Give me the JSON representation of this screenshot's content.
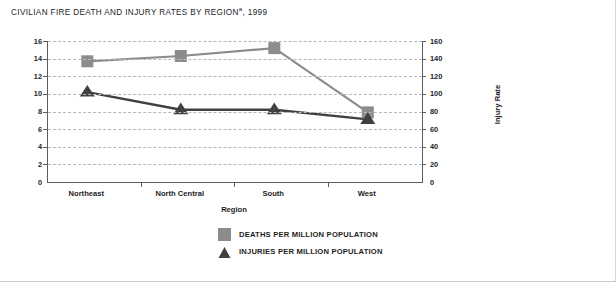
{
  "chart_data": {
    "type": "line",
    "title": "CIVILIAN FIRE DEATH AND INJURY RATES BY REGION",
    "title_superscript": "a",
    "title_suffix": ", 1999",
    "categories": [
      "Northeast",
      "North Central",
      "South",
      "West"
    ],
    "xlabel": "Region",
    "ylabel": "Death Rates",
    "ylabel_right": "Injury Rate",
    "ylim": [
      0,
      16
    ],
    "ylim_right": [
      0,
      160
    ],
    "yticks": [
      "16",
      "14",
      "12",
      "10",
      "8",
      "6",
      "4",
      "2",
      "0"
    ],
    "yticks_right": [
      "160",
      "140",
      "120",
      "100",
      "80",
      "60",
      "40",
      "20",
      "0"
    ],
    "grid": true,
    "legend_position": "bottom-center",
    "series": [
      {
        "name": "DEATHS PER MILLION POPULATION",
        "axis": "left",
        "marker": "square",
        "color": "#8c8c8c",
        "values": [
          13.7,
          14.3,
          15.2,
          7.9
        ]
      },
      {
        "name": "INJURIES PER MILLION POPULATION",
        "axis": "right",
        "marker": "triangle",
        "color": "#404040",
        "values": [
          102,
          82,
          82,
          71
        ]
      }
    ]
  },
  "legend": {
    "items": [
      {
        "label": "DEATHS PER MILLION POPULATION",
        "color": "#8c8c8c",
        "marker": "square"
      },
      {
        "label": "INJURIES PER MILLION POPULATION",
        "color": "#404040",
        "marker": "triangle"
      }
    ]
  }
}
